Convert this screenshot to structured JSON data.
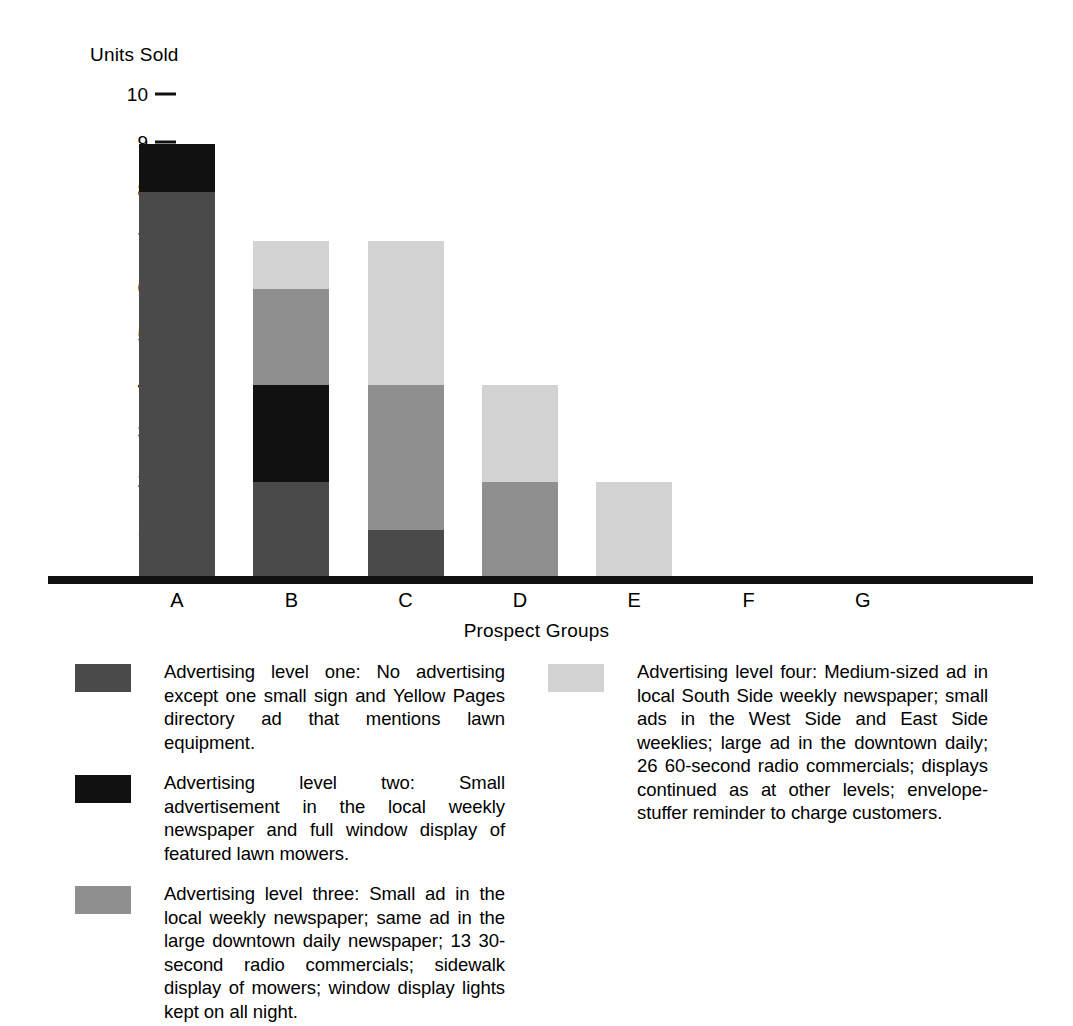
{
  "chart_data": {
    "type": "bar",
    "stacked": true,
    "title": "",
    "ylabel": "Units Sold",
    "xlabel": "Prospect Groups",
    "categories": [
      "A",
      "B",
      "C",
      "D",
      "E",
      "F",
      "G"
    ],
    "ylim": [
      0,
      10
    ],
    "yticks": [
      10,
      9,
      8,
      7,
      6,
      5,
      4,
      3,
      2,
      1
    ],
    "grid": false,
    "legend_position": "below-chart-two-columns",
    "series": [
      {
        "name": "Advertising level one",
        "color": "#4a4a4a",
        "values": [
          8,
          2,
          1,
          0,
          0,
          0,
          0
        ]
      },
      {
        "name": "Advertising level two",
        "color": "#111111",
        "values": [
          1,
          2,
          0,
          0,
          0,
          0,
          0
        ]
      },
      {
        "name": "Advertising level three",
        "color": "#8f8f8f",
        "values": [
          0,
          2,
          3,
          2,
          0,
          0,
          0
        ]
      },
      {
        "name": "Advertising level four",
        "color": "#d3d3d3",
        "values": [
          0,
          1,
          3,
          2,
          2,
          0,
          0
        ]
      }
    ],
    "totals": [
      9,
      7,
      7,
      4,
      2,
      0,
      0
    ]
  },
  "axes": {
    "y_title": "Units Sold",
    "x_title": "Prospect Groups",
    "y_tick_labels": [
      "10",
      "9",
      "8",
      "7",
      "6",
      "5",
      "4",
      "3",
      "2",
      "1"
    ],
    "x_tick_labels": [
      "A",
      "B",
      "C",
      "D",
      "E",
      "F",
      "G"
    ]
  },
  "legend": {
    "items": [
      {
        "swatch_color": "#4a4a4a",
        "swatch_name": "legend-swatch-level-one",
        "text": "Advertising level one: No advertising except one small sign and Yellow Pages directory ad that mentions lawn equipment."
      },
      {
        "swatch_color": "#111111",
        "swatch_name": "legend-swatch-level-two",
        "text": "Advertising level two: Small advertisement in the local weekly newspaper and full window display of featured lawn mowers."
      },
      {
        "swatch_color": "#8f8f8f",
        "swatch_name": "legend-swatch-level-three",
        "text": "Advertising level three: Small ad in the local weekly newspaper; same ad in the large downtown daily newspaper; 13 30-second radio commercials; sidewalk display of mowers; window display lights kept on all night."
      },
      {
        "swatch_color": "#d3d3d3",
        "swatch_name": "legend-swatch-level-four",
        "text": "Advertising level four: Medium-sized ad in local South Side weekly newspaper; small ads in the West Side and East Side weeklies; large ad in the downtown daily; 26 60-second radio commercials; displays continued as at other levels; envelope-stuffer reminder to charge customers."
      }
    ]
  }
}
